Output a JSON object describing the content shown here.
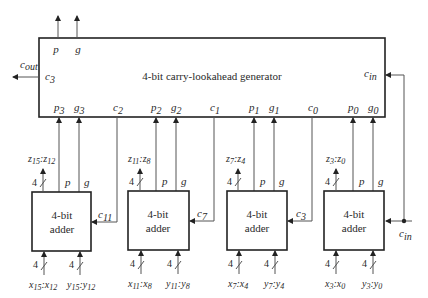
{
  "diagram": {
    "title": "4-bit carry-lookahead generator",
    "generator": {
      "label": "4-bit carry-lookahead generator",
      "top_outputs": [
        {
          "name": "p",
          "sub": ""
        },
        {
          "name": "g",
          "sub": ""
        }
      ],
      "left_port": {
        "name": "c",
        "sub": "3"
      },
      "right_port": {
        "name": "c",
        "sub": "in"
      },
      "external_out": {
        "name": "c",
        "sub": "out"
      },
      "bottom_ports": [
        {
          "name": "p",
          "sub": "3"
        },
        {
          "name": "g",
          "sub": "3"
        },
        {
          "name": "c",
          "sub": "2"
        },
        {
          "name": "p",
          "sub": "2"
        },
        {
          "name": "g",
          "sub": "2"
        },
        {
          "name": "c",
          "sub": "1"
        },
        {
          "name": "p",
          "sub": "1"
        },
        {
          "name": "g",
          "sub": "1"
        },
        {
          "name": "c",
          "sub": "0"
        },
        {
          "name": "p",
          "sub": "0"
        },
        {
          "name": "g",
          "sub": "0"
        }
      ]
    },
    "adders": [
      {
        "label_line1": "4-bit",
        "label_line2": "adder",
        "output": {
          "a": "z",
          "a_sub": "15",
          "b": "z",
          "b_sub": "12"
        },
        "carry_in": {
          "name": "c",
          "sub": "11"
        },
        "p_label": "p",
        "g_label": "g",
        "x_in": {
          "a": "x",
          "a_sub": "15",
          "b": "x",
          "b_sub": "12"
        },
        "y_in": {
          "a": "y",
          "a_sub": "15",
          "b": "y",
          "b_sub": "12"
        },
        "bus_width": "4"
      },
      {
        "label_line1": "4-bit",
        "label_line2": "adder",
        "output": {
          "a": "z",
          "a_sub": "11",
          "b": "z",
          "b_sub": "8"
        },
        "carry_in": {
          "name": "c",
          "sub": "7"
        },
        "p_label": "p",
        "g_label": "g",
        "x_in": {
          "a": "x",
          "a_sub": "11",
          "b": "x",
          "b_sub": "8"
        },
        "y_in": {
          "a": "y",
          "a_sub": "11",
          "b": "y",
          "b_sub": "8"
        },
        "bus_width": "4"
      },
      {
        "label_line1": "4-bit",
        "label_line2": "adder",
        "output": {
          "a": "z",
          "a_sub": "7",
          "b": "z",
          "b_sub": "4"
        },
        "carry_in": {
          "name": "c",
          "sub": "3"
        },
        "p_label": "p",
        "g_label": "g",
        "x_in": {
          "a": "x",
          "a_sub": "7",
          "b": "x",
          "b_sub": "4"
        },
        "y_in": {
          "a": "y",
          "a_sub": "7",
          "b": "y",
          "b_sub": "4"
        },
        "bus_width": "4"
      },
      {
        "label_line1": "4-bit",
        "label_line2": "adder",
        "output": {
          "a": "z",
          "a_sub": "3",
          "b": "z",
          "b_sub": "0"
        },
        "carry_in": {
          "name": "c",
          "sub": "in"
        },
        "p_label": "p",
        "g_label": "g",
        "x_in": {
          "a": "x",
          "a_sub": "3",
          "b": "x",
          "b_sub": "0"
        },
        "y_in": {
          "a": "y",
          "a_sub": "3",
          "b": "y",
          "b_sub": "0"
        },
        "bus_width": "4"
      }
    ],
    "colors": {
      "line": "#555555",
      "box": "#222222",
      "text": "#2a2a2a"
    }
  }
}
